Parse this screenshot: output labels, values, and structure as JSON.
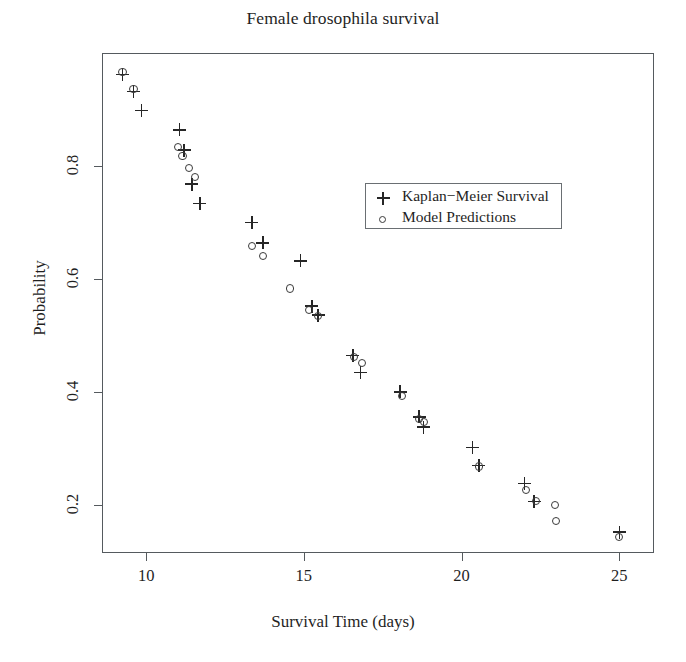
{
  "chart_data": {
    "type": "scatter",
    "title": "Female drosophila survival",
    "xlabel": "Survival Time (days)",
    "ylabel": "Probability",
    "xlim": [
      8.6,
      26.1
    ],
    "ylim": [
      0.115,
      1.0
    ],
    "xticks": [
      10,
      15,
      20,
      25
    ],
    "xticklabels": [
      "10",
      "15",
      "20",
      "25"
    ],
    "yticks": [
      0.2,
      0.4,
      0.6,
      0.8
    ],
    "yticklabels": [
      "0.2",
      "0.4",
      "0.6",
      "0.8"
    ],
    "grid": false,
    "legend_position": "center-right",
    "series": [
      {
        "name": "Kaplan−Meier Survival",
        "marker": "plus",
        "color": "#262626",
        "points": [
          [
            9.25,
            0.962
          ],
          [
            9.6,
            0.932
          ],
          [
            9.85,
            0.898
          ],
          [
            11.05,
            0.864
          ],
          [
            11.2,
            0.828
          ],
          [
            11.45,
            0.768
          ],
          [
            11.7,
            0.734
          ],
          [
            13.35,
            0.7
          ],
          [
            13.7,
            0.664
          ],
          [
            14.9,
            0.632
          ],
          [
            15.25,
            0.552
          ],
          [
            15.45,
            0.536
          ],
          [
            16.55,
            0.465
          ],
          [
            16.8,
            0.435
          ],
          [
            18.05,
            0.4
          ],
          [
            18.65,
            0.356
          ],
          [
            18.8,
            0.338
          ],
          [
            20.35,
            0.302
          ],
          [
            20.55,
            0.27
          ],
          [
            22.0,
            0.238
          ],
          [
            22.3,
            0.206
          ],
          [
            25.0,
            0.152
          ]
        ]
      },
      {
        "name": "Model Predictions",
        "marker": "circle",
        "color": "#3a3a3a",
        "points": [
          [
            9.25,
            0.966
          ],
          [
            9.6,
            0.936
          ],
          [
            11.0,
            0.833
          ],
          [
            11.15,
            0.818
          ],
          [
            11.35,
            0.796
          ],
          [
            11.55,
            0.78
          ],
          [
            13.35,
            0.659
          ],
          [
            13.7,
            0.641
          ],
          [
            14.55,
            0.583
          ],
          [
            15.15,
            0.545
          ],
          [
            15.45,
            0.535
          ],
          [
            16.6,
            0.462
          ],
          [
            16.85,
            0.452
          ],
          [
            18.1,
            0.393
          ],
          [
            18.65,
            0.352
          ],
          [
            18.8,
            0.347
          ],
          [
            20.55,
            0.268
          ],
          [
            22.05,
            0.226
          ],
          [
            22.35,
            0.207
          ],
          [
            22.95,
            0.2
          ],
          [
            23.0,
            0.172
          ],
          [
            25.0,
            0.143
          ]
        ]
      }
    ]
  }
}
